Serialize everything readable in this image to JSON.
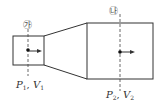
{
  "diagram": {
    "type": "pipe-expansion",
    "sections": [
      {
        "marker": "㉮",
        "pressure_symbol": "P",
        "pressure_subscript": "1",
        "velocity_symbol": "V",
        "velocity_subscript": "1",
        "separator": ", "
      },
      {
        "marker": "㉯",
        "pressure_symbol": "P",
        "pressure_subscript": "2",
        "velocity_symbol": "V",
        "velocity_subscript": "2",
        "separator": ", "
      }
    ],
    "colors": {
      "stroke": "#333333",
      "text": "#333333"
    }
  }
}
